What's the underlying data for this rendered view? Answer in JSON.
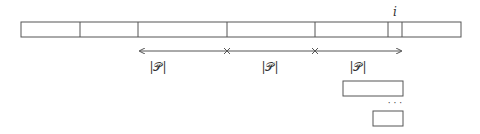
{
  "diagram": {
    "bar": {
      "x": 21,
      "y": 22,
      "width": 440,
      "height": 15,
      "dividers": [
        80,
        138,
        227,
        315,
        388,
        402
      ]
    },
    "index_label": {
      "text": "i",
      "x": 395,
      "y": 15
    },
    "arrow": {
      "y": 51,
      "x_start": 138,
      "x_end": 403,
      "ticks": [
        227,
        315
      ]
    },
    "segment_labels": [
      {
        "text": "|𝒫|",
        "x": 158,
        "y": 71
      },
      {
        "text": "|𝒫|",
        "x": 270,
        "y": 71
      },
      {
        "text": "|𝒫|",
        "x": 358,
        "y": 71
      }
    ],
    "boxes": [
      {
        "x": 343,
        "y": 81,
        "width": 60,
        "height": 15
      },
      {
        "x": 373,
        "y": 111,
        "width": 30,
        "height": 15
      }
    ],
    "ellipsis": {
      "text": "· · ·",
      "x": 395,
      "y": 106
    },
    "colors": {
      "stroke": "#555555",
      "text": "#333333",
      "background": "#ffffff"
    }
  }
}
